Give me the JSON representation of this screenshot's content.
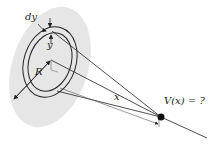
{
  "diagram": {
    "labels": {
      "dy": "dy",
      "y": "y",
      "R": "R",
      "x": "x",
      "V": "V(x) = ?"
    },
    "colors": {
      "disk_fill": "#e6e6e6",
      "stroke": "#222222",
      "point": "#111111"
    }
  }
}
